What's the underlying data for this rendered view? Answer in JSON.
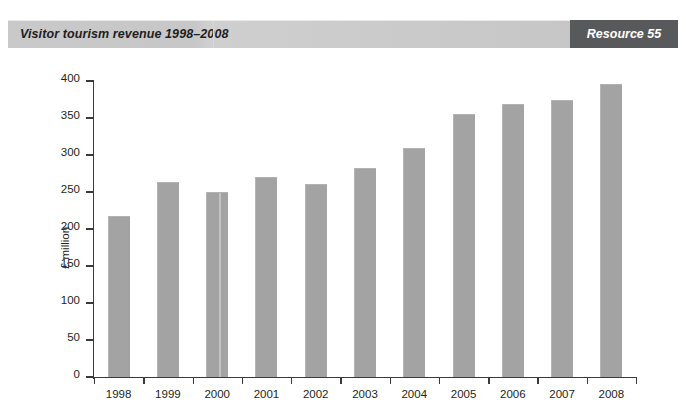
{
  "header": {
    "title": "Visitor tourism revenue 1998–2008",
    "badge_label": "Resource 55",
    "band_color": "#c7c7c7",
    "badge_color": "#58595b"
  },
  "chart_data": {
    "type": "bar",
    "title": "Visitor tourism revenue 1998–2008",
    "xlabel": "",
    "ylabel": "£ million",
    "categories": [
      "1998",
      "1999",
      "2000",
      "2001",
      "2002",
      "2003",
      "2004",
      "2005",
      "2006",
      "2007",
      "2008"
    ],
    "values": [
      217,
      263,
      250,
      270,
      261,
      282,
      309,
      356,
      369,
      374,
      396
    ],
    "ylim": [
      0,
      400
    ],
    "ytick_labels": [
      "0",
      "50",
      "100",
      "150",
      "200",
      "250",
      "300",
      "350",
      "400"
    ],
    "ytick_values": [
      0,
      50,
      100,
      150,
      200,
      250,
      300,
      350,
      400
    ],
    "grid": false,
    "legend": null,
    "bar_color": "#a3a3a3",
    "axis_color": "#3a3a3a"
  }
}
